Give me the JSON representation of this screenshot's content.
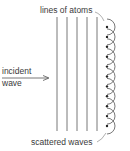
{
  "diagram": {
    "labels": {
      "top": "lines of atoms",
      "incident_line1": "incident",
      "incident_line2": "wave",
      "bottom": "scattered waves"
    },
    "lines": {
      "count": 5,
      "x": [
        57,
        67,
        77,
        87,
        97
      ],
      "y_top": 17,
      "y_bottom": 131
    },
    "atoms": {
      "count": 11,
      "x": 107,
      "y_start": 27,
      "spacing": 9.9,
      "arc_radius": 8
    },
    "colors": {
      "stroke": "#555555",
      "text": "#3a3a3a",
      "dot": "#222222"
    }
  }
}
